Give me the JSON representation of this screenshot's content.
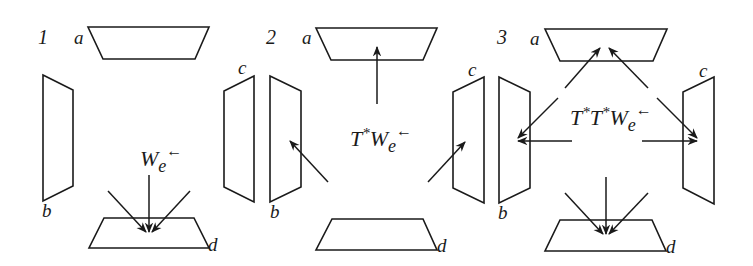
{
  "figure": {
    "colors": {
      "stroke": "#1a1a1a",
      "background": "#ffffff"
    },
    "panels": [
      {
        "number": "1",
        "labels": {
          "a": "a",
          "b": "b",
          "c": "c",
          "d": "d"
        },
        "formula": {
          "main": "W",
          "sub": "e",
          "arrow": "←"
        },
        "arrows": "three arrows converging downward onto region d"
      },
      {
        "number": "2",
        "labels": {
          "a": "a",
          "b": "b",
          "c": "c",
          "d": "d"
        },
        "formula": {
          "t1": "T",
          "star1": "*",
          "main": "W",
          "sub": "e",
          "arrow": "←"
        },
        "arrows": "arrows pointing to regions a, b and c"
      },
      {
        "number": "3",
        "labels": {
          "a": "a",
          "b": "b",
          "c": "c",
          "d": "d"
        },
        "formula": {
          "t1": "T",
          "star1": "*",
          "t2": "T",
          "star2": "*",
          "main": "W",
          "sub": "e",
          "arrow": "←"
        },
        "arrows": "arrows pointing to regions a (2), b (2), c (2) and d (3)"
      }
    ]
  }
}
